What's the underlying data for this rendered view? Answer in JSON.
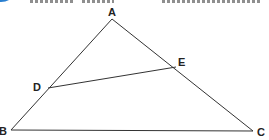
{
  "figure": {
    "type": "triangle-with-segment",
    "line_color": "#333333",
    "accent_color": "#2a7fd0",
    "points": {
      "A": {
        "label": "A",
        "x": 112,
        "y": 19
      },
      "B": {
        "label": "B",
        "x": 11,
        "y": 130
      },
      "C": {
        "label": "C",
        "x": 253,
        "y": 131
      },
      "D": {
        "label": "D",
        "x": 48,
        "y": 88
      },
      "E": {
        "label": "E",
        "x": 176,
        "y": 67
      }
    },
    "segments": [
      "AB",
      "AC",
      "BC",
      "DE"
    ]
  }
}
